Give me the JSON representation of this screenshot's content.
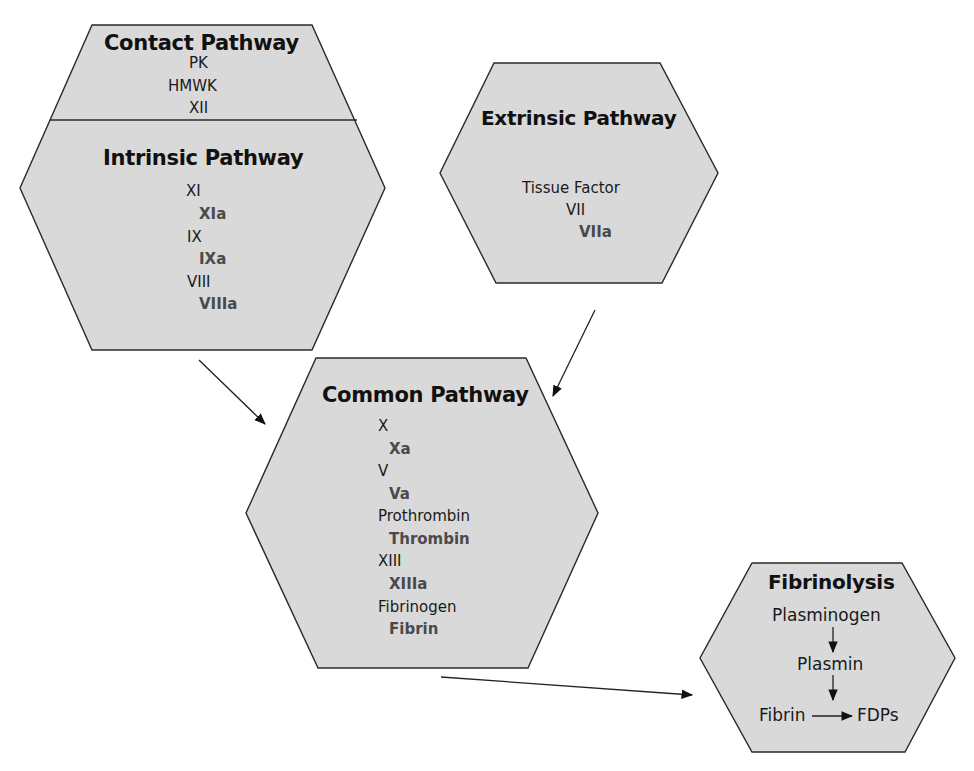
{
  "diagram": {
    "colors": {
      "hex_fill": "#d9d9d9",
      "hex_stroke": "#2a2a2a",
      "factor_text": "#1a1a1a",
      "activated_text": "#4a4a4a"
    },
    "contact": {
      "title": "Contact Pathway",
      "items": [
        "PK",
        "HMWK",
        "XII"
      ]
    },
    "intrinsic": {
      "title": "Intrinsic Pathway",
      "items": [
        {
          "label": "XI",
          "activated": false
        },
        {
          "label": "XIa",
          "activated": true
        },
        {
          "label": "IX",
          "activated": false
        },
        {
          "label": "IXa",
          "activated": true
        },
        {
          "label": "VIII",
          "activated": false
        },
        {
          "label": "VIIIa",
          "activated": true
        }
      ]
    },
    "extrinsic": {
      "title": "Extrinsic Pathway",
      "items": [
        {
          "label": "Tissue Factor",
          "activated": false
        },
        {
          "label": "VII",
          "activated": false
        },
        {
          "label": "VIIa",
          "activated": true
        }
      ]
    },
    "common": {
      "title": "Common Pathway",
      "items": [
        {
          "label": "X",
          "activated": false
        },
        {
          "label": "Xa",
          "activated": true
        },
        {
          "label": "V",
          "activated": false
        },
        {
          "label": "Va",
          "activated": true
        },
        {
          "label": "Prothrombin",
          "activated": false
        },
        {
          "label": "Thrombin",
          "activated": true
        },
        {
          "label": "XIII",
          "activated": false
        },
        {
          "label": "XIIIa",
          "activated": true
        },
        {
          "label": "Fibrinogen",
          "activated": false
        },
        {
          "label": "Fibrin",
          "activated": true
        }
      ]
    },
    "fibrinolysis": {
      "title": "Fibrinolysis",
      "plasminogen": "Plasminogen",
      "plasmin": "Plasmin",
      "fibrin": "Fibrin",
      "fdps": "FDPs"
    },
    "edges": [
      {
        "from": "intrinsic",
        "to": "common"
      },
      {
        "from": "extrinsic",
        "to": "common"
      },
      {
        "from": "common",
        "to": "fibrinolysis"
      }
    ]
  }
}
